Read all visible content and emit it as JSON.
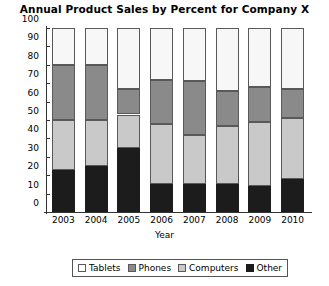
{
  "chart_data": {
    "type": "bar",
    "subtype": "stacked-bar",
    "title": "Annual Product Sales by Percent for Company X",
    "xlabel": "Year",
    "ylabel": "Revenue",
    "categories": [
      "2003",
      "2004",
      "2005",
      "2006",
      "2007",
      "2008",
      "2009",
      "2010"
    ],
    "ylim": [
      0,
      100
    ],
    "yticks": [
      0,
      10,
      20,
      30,
      40,
      50,
      60,
      70,
      80,
      90,
      100
    ],
    "grid": false,
    "legend_position": "bottom",
    "stack_order_bottom_to_top": [
      "Other",
      "Computers",
      "Phones",
      "Tablets"
    ],
    "series": [
      {
        "name": "Other",
        "color": "#1c1c1c",
        "values": [
          23,
          25,
          35,
          15,
          15,
          15,
          14,
          18
        ]
      },
      {
        "name": "Computers",
        "color": "#c9c9c9",
        "values": [
          27,
          25,
          18,
          33,
          27,
          32,
          35,
          33
        ]
      },
      {
        "name": "Phones",
        "color": "#8a8a8a",
        "values": [
          30,
          30,
          14,
          24,
          29,
          19,
          19,
          16
        ]
      },
      {
        "name": "Tablets",
        "color": "#f7f7f7",
        "values": [
          20,
          20,
          33,
          28,
          29,
          34,
          32,
          33
        ]
      }
    ],
    "cumulative_tops": {
      "2003": {
        "Other": 23,
        "Computers": 50,
        "Phones": 80,
        "Tablets": 100
      },
      "2004": {
        "Other": 25,
        "Computers": 50,
        "Phones": 80,
        "Tablets": 100
      },
      "2005": {
        "Other": 35,
        "Computers": 53,
        "Phones": 67,
        "Tablets": 100
      },
      "2006": {
        "Other": 15,
        "Computers": 48,
        "Phones": 72,
        "Tablets": 100
      },
      "2007": {
        "Other": 15,
        "Computers": 42,
        "Phones": 71,
        "Tablets": 100
      },
      "2008": {
        "Other": 15,
        "Computers": 47,
        "Phones": 66,
        "Tablets": 100
      },
      "2009": {
        "Other": 14,
        "Computers": 49,
        "Phones": 68,
        "Tablets": 100
      },
      "2010": {
        "Other": 18,
        "Computers": 51,
        "Phones": 67,
        "Tablets": 100
      }
    }
  },
  "legend": {
    "items": [
      {
        "label": "Tablets",
        "key": "tablets"
      },
      {
        "label": "Phones",
        "key": "phones"
      },
      {
        "label": "Computers",
        "key": "computers"
      },
      {
        "label": "Other",
        "key": "other"
      }
    ]
  }
}
